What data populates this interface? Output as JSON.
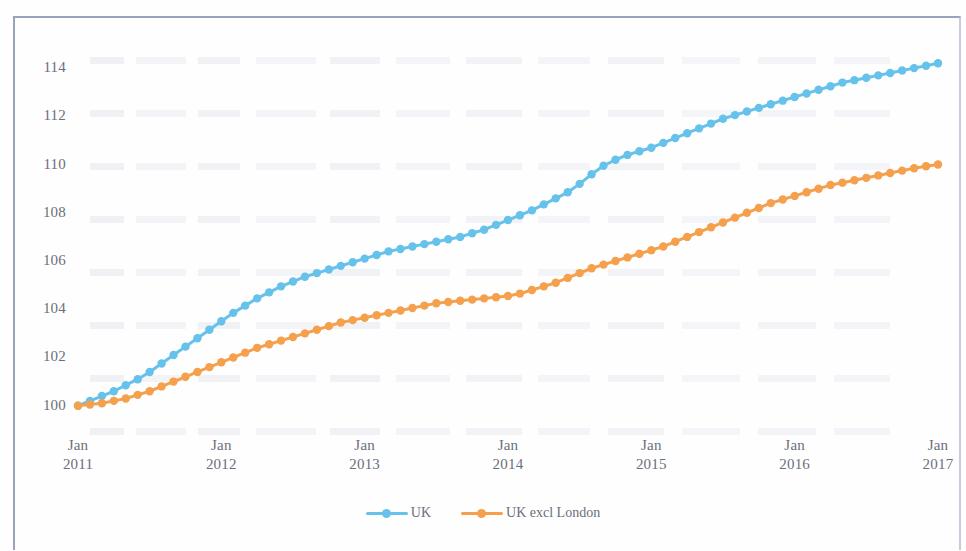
{
  "frame": {
    "border_color": "#9aa3bd"
  },
  "chart_data": {
    "type": "line",
    "title": "",
    "subtitle": "",
    "xlabel": "",
    "ylabel": "",
    "ylim": [
      99.2,
      115.0
    ],
    "y_ticks": [
      100,
      102,
      104,
      106,
      108,
      110,
      112,
      114
    ],
    "x_tick_labels": [
      {
        "month": "Jan",
        "year": "2011"
      },
      {
        "month": "Jan",
        "year": "2012"
      },
      {
        "month": "Jan",
        "year": "2013"
      },
      {
        "month": "Jan",
        "year": "2014"
      },
      {
        "month": "Jan",
        "year": "2015"
      },
      {
        "month": "Jan",
        "year": "2016"
      },
      {
        "month": "Jan",
        "year": "2017"
      }
    ],
    "x_start": "Jan 2011",
    "x_end": "Jan 2017",
    "x_frequency": "monthly",
    "grid": false,
    "legend_position": "bottom",
    "markers": true,
    "marker_shape": "circle",
    "series": [
      {
        "name": "UK",
        "color": "#66c2ea",
        "values": [
          100.0,
          100.2,
          100.4,
          100.6,
          100.85,
          101.1,
          101.4,
          101.75,
          102.1,
          102.45,
          102.8,
          103.15,
          103.5,
          103.85,
          104.15,
          104.45,
          104.7,
          104.95,
          105.15,
          105.35,
          105.5,
          105.65,
          105.8,
          105.95,
          106.1,
          106.25,
          106.4,
          106.5,
          106.6,
          106.7,
          106.8,
          106.9,
          107.0,
          107.15,
          107.3,
          107.5,
          107.7,
          107.9,
          108.1,
          108.35,
          108.6,
          108.85,
          109.2,
          109.6,
          109.95,
          110.2,
          110.4,
          110.55,
          110.7,
          110.9,
          111.1,
          111.3,
          111.5,
          111.7,
          111.9,
          112.05,
          112.2,
          112.35,
          112.5,
          112.65,
          112.8,
          112.95,
          113.1,
          113.25,
          113.4,
          113.5,
          113.6,
          113.7,
          113.8,
          113.9,
          114.0,
          114.1,
          114.2
        ]
      },
      {
        "name": "UK excl London",
        "color": "#f4a04c",
        "values": [
          100.0,
          100.05,
          100.1,
          100.2,
          100.3,
          100.45,
          100.6,
          100.8,
          101.0,
          101.2,
          101.4,
          101.6,
          101.8,
          102.0,
          102.2,
          102.4,
          102.55,
          102.7,
          102.85,
          103.0,
          103.15,
          103.3,
          103.45,
          103.55,
          103.65,
          103.75,
          103.85,
          103.95,
          104.05,
          104.15,
          104.25,
          104.3,
          104.35,
          104.4,
          104.45,
          104.5,
          104.55,
          104.65,
          104.8,
          104.95,
          105.1,
          105.3,
          105.5,
          105.7,
          105.85,
          106.0,
          106.15,
          106.3,
          106.45,
          106.6,
          106.8,
          107.0,
          107.2,
          107.4,
          107.6,
          107.8,
          108.0,
          108.2,
          108.4,
          108.55,
          108.7,
          108.85,
          109.0,
          109.15,
          109.25,
          109.35,
          109.45,
          109.55,
          109.65,
          109.75,
          109.85,
          109.93,
          110.0
        ]
      }
    ]
  },
  "legend": {
    "items": [
      {
        "label": "UK",
        "color": "#66c2ea"
      },
      {
        "label": "UK excl London",
        "color": "#f4a04c"
      }
    ]
  }
}
